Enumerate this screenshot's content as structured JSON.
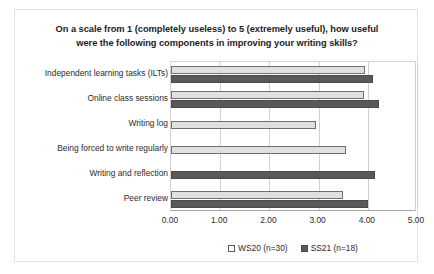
{
  "chart_data": {
    "type": "bar",
    "orientation": "horizontal",
    "title": "On a scale from 1 (completely useless) to 5 (extremely useful), how useful were the following components in improving your writing skills?",
    "title_lines": [
      "On a scale from 1 (completely useless) to 5 (extremely useful), how useful",
      "were the following components in improving your writing skills?"
    ],
    "xlabel": "",
    "ylabel": "",
    "xlim": [
      0,
      5
    ],
    "xticks": [
      0,
      1,
      2,
      3,
      4,
      5
    ],
    "xtick_labels": [
      "0.00",
      "1.00",
      "2.00",
      "3.00",
      "4.00",
      "5.00"
    ],
    "grid": true,
    "grid_axis": "x",
    "legend_position": "bottom",
    "categories": [
      "Independent learning tasks (ILTs)",
      "Online class sessions",
      "Writing log",
      "Being forced to write regularly",
      "Writing and reflection",
      "Peer review"
    ],
    "series": [
      {
        "name": "WS20 (n=30)",
        "color": "#e0e0e0",
        "border_color": "#6f6f6f",
        "values": [
          3.95,
          3.92,
          2.95,
          3.55,
          null,
          3.5
        ]
      },
      {
        "name": "SS21 (n=18)",
        "color": "#595959",
        "border_color": "#4a4a4a",
        "values": [
          4.1,
          4.22,
          null,
          null,
          4.15,
          4.0
        ]
      }
    ]
  },
  "legend": {
    "entries": [
      {
        "label": "WS20 (n=30)",
        "swatch": "open-square-marker"
      },
      {
        "label": "SS21 (n=18)",
        "swatch": "filled-square-marker"
      }
    ]
  },
  "colors": {
    "ws20_fill": "#e0e0e0",
    "ss21_fill": "#595959",
    "grid": "#d2d2d2",
    "axis": "#a6a6a6",
    "text": "#2b2b2b",
    "card_border": "#e3e3e3"
  }
}
